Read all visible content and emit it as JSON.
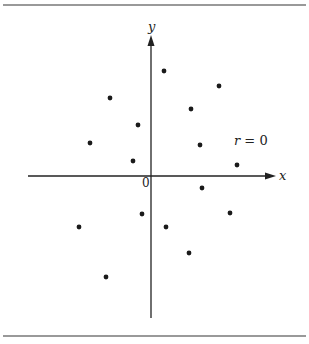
{
  "chart_data": {
    "type": "scatter",
    "title": "",
    "annotation": "r = 0",
    "xlabel": "x",
    "ylabel": "y",
    "origin_label": "0",
    "grid": false,
    "legend": null,
    "axis_ranges": {
      "x": [
        -5.5,
        5.5
      ],
      "y": [
        -6,
        6
      ]
    },
    "points": [
      {
        "x": 0.5,
        "y": 4.2
      },
      {
        "x": 2.6,
        "y": 3.6
      },
      {
        "x": -1.6,
        "y": 3.0
      },
      {
        "x": 1.5,
        "y": 2.6
      },
      {
        "x": -0.5,
        "y": 2.0
      },
      {
        "x": -2.3,
        "y": 1.3
      },
      {
        "x": 1.9,
        "y": 1.2
      },
      {
        "x": -0.7,
        "y": 0.6
      },
      {
        "x": 3.3,
        "y": 0.4
      },
      {
        "x": 1.9,
        "y": -0.5
      },
      {
        "x": -0.4,
        "y": -1.5
      },
      {
        "x": 3.0,
        "y": -1.4
      },
      {
        "x": -2.8,
        "y": -2.0
      },
      {
        "x": 0.6,
        "y": -2.0
      },
      {
        "x": 1.5,
        "y": -3.0
      },
      {
        "x": -1.7,
        "y": -3.9
      }
    ],
    "pixel_points": [
      [
        164,
        71
      ],
      [
        219,
        86
      ],
      [
        110,
        98
      ],
      [
        191,
        109
      ],
      [
        138,
        125
      ],
      [
        90,
        143
      ],
      [
        200,
        145
      ],
      [
        133,
        161
      ],
      [
        237,
        165
      ],
      [
        202,
        188
      ],
      [
        142,
        214
      ],
      [
        230,
        213
      ],
      [
        79,
        227
      ],
      [
        166,
        227
      ],
      [
        189,
        253
      ],
      [
        106,
        277
      ]
    ]
  },
  "labels": {
    "x_axis": "x",
    "y_axis": "y",
    "origin": "0",
    "annotation": "r = 0"
  }
}
